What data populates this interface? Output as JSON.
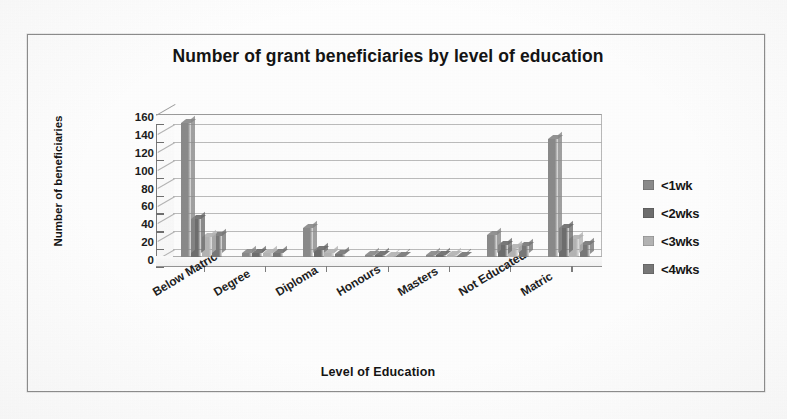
{
  "chart_data": {
    "type": "bar",
    "title": "Number of grant beneficiaries by level of education",
    "xlabel": "Level of Education",
    "ylabel": "Number of beneficiaries",
    "ylim": [
      0,
      160
    ],
    "yticks": [
      160,
      140,
      120,
      100,
      80,
      60,
      40,
      20,
      0
    ],
    "grid": true,
    "legend_position": "right",
    "categories": [
      "Below Matric",
      "Degree",
      "Diploma",
      "Honours",
      "Masters",
      "Not Educated",
      "Matric"
    ],
    "series": [
      {
        "name": "<1wk",
        "color": "#8a8a8a",
        "values": [
          150,
          5,
          33,
          2,
          2,
          25,
          132
        ]
      },
      {
        "name": "<2wks",
        "color": "#6e6e6e",
        "values": [
          42,
          4,
          8,
          2,
          2,
          14,
          33
        ]
      },
      {
        "name": "<3wks",
        "color": "#b4b4b4",
        "values": [
          22,
          4,
          5,
          1,
          2,
          10,
          20
        ]
      },
      {
        "name": "<4wks",
        "color": "#787878",
        "values": [
          24,
          4,
          3,
          1,
          1,
          12,
          14
        ]
      }
    ]
  },
  "legend": {
    "items": [
      {
        "label": "<1wk",
        "color": "#8a8a8a"
      },
      {
        "label": "<2wks",
        "color": "#6e6e6e"
      },
      {
        "label": "<3wks",
        "color": "#b4b4b4"
      },
      {
        "label": "<4wks",
        "color": "#787878"
      }
    ]
  }
}
